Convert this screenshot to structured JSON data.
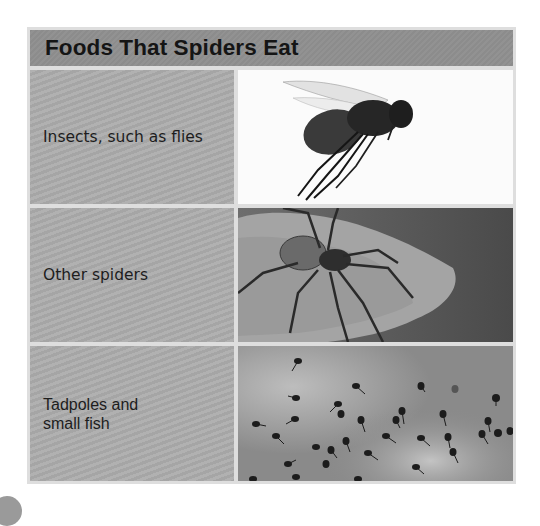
{
  "table": {
    "title": "Foods That Spiders Eat",
    "rows": [
      {
        "label": "Insects, such as flies",
        "image": "fly-photo"
      },
      {
        "label": "Other spiders",
        "image": "spider-on-leaf-photo"
      },
      {
        "label": "Tadpoles and\nsmall fish",
        "label_line1": "Tadpoles and",
        "label_line2": "small fish",
        "image": "tadpoles-photo"
      }
    ]
  },
  "colors": {
    "header_bg": "#8e8e8e",
    "cell_bg": "#acacac",
    "border": "#dedede",
    "text": "#1d1d1d"
  }
}
